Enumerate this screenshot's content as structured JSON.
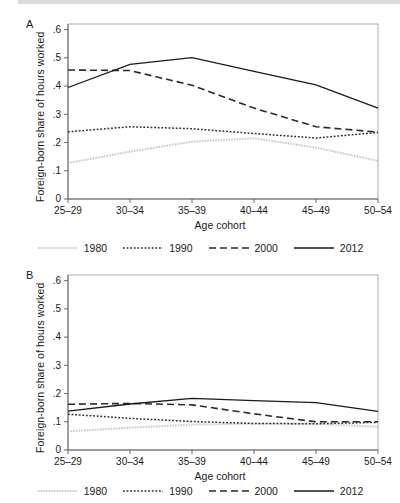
{
  "figure": {
    "panels": [
      {
        "letter": "A",
        "ylabel": "Foreign-born share of hours worked",
        "xlabel": "Age cohort"
      },
      {
        "letter": "B",
        "ylabel": "Foreign-born share of hours worked",
        "xlabel": "Age cohort"
      }
    ],
    "legend": {
      "items": [
        {
          "label": "1980",
          "style": "fine-dotted",
          "color": "#b9b9b9"
        },
        {
          "label": "1990",
          "style": "dotted",
          "color": "#2a2a2a"
        },
        {
          "label": "2000",
          "style": "dashed",
          "color": "#2a2a2a"
        },
        {
          "label": "2012",
          "style": "solid",
          "color": "#1a1a1a"
        }
      ]
    }
  },
  "chart_data": [
    {
      "type": "line",
      "title": "A",
      "xlabel": "Age cohort",
      "ylabel": "Foreign-born share of hours worked",
      "categories": [
        "25–29",
        "30–34",
        "35–39",
        "40–44",
        "45–49",
        "50–54"
      ],
      "ytick_labels": [
        "0",
        ".1",
        ".2",
        ".3",
        ".4",
        ".5",
        ".6"
      ],
      "ytick_values": [
        0,
        0.1,
        0.2,
        0.3,
        0.4,
        0.5,
        0.6
      ],
      "ylim": [
        0,
        0.62
      ],
      "grid": false,
      "legend_position": "below",
      "series": [
        {
          "name": "1980",
          "values": [
            0.127,
            0.168,
            0.203,
            0.215,
            0.182,
            0.135
          ]
        },
        {
          "name": "1990",
          "values": [
            0.238,
            0.256,
            0.249,
            0.232,
            0.216,
            0.236
          ]
        },
        {
          "name": "2000",
          "values": [
            0.457,
            0.455,
            0.403,
            0.322,
            0.256,
            0.237
          ]
        },
        {
          "name": "2012",
          "values": [
            0.395,
            0.477,
            0.501,
            0.452,
            0.404,
            0.322
          ]
        }
      ]
    },
    {
      "type": "line",
      "title": "B",
      "xlabel": "Age cohort",
      "ylabel": "Foreign-born share of hours worked",
      "categories": [
        "25–29",
        "30–34",
        "35–39",
        "40–44",
        "45–49",
        "50–54"
      ],
      "ytick_labels": [
        "0",
        ".1",
        ".2",
        ".3",
        ".4",
        ".5",
        ".6"
      ],
      "ytick_values": [
        0,
        0.1,
        0.2,
        0.3,
        0.4,
        0.5,
        0.6
      ],
      "ylim": [
        0,
        0.62
      ],
      "grid": false,
      "legend_position": "below",
      "series": [
        {
          "name": "1980",
          "values": [
            0.066,
            0.079,
            0.09,
            0.093,
            0.093,
            0.082
          ]
        },
        {
          "name": "1990",
          "values": [
            0.127,
            0.112,
            0.101,
            0.094,
            0.093,
            0.098
          ]
        },
        {
          "name": "2000",
          "values": [
            0.162,
            0.165,
            0.16,
            0.128,
            0.1,
            0.1
          ]
        },
        {
          "name": "2012",
          "values": [
            0.138,
            0.163,
            0.183,
            0.175,
            0.168,
            0.137
          ]
        }
      ]
    }
  ]
}
